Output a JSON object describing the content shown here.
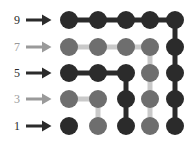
{
  "figure": {
    "type": "graph-lattice-diagram",
    "background_color": "#ffffff",
    "width": 190,
    "height": 148
  },
  "colors": {
    "dark": "#2b2b2b",
    "medium_gray": "#6e6e6e",
    "light_gray": "#c9c9c9",
    "label_dark": "#2b2b2b",
    "label_gray": "#9a9a9a"
  },
  "axis": {
    "orientation": "vertical-left",
    "rows": [
      {
        "label": "9",
        "y": 20,
        "color": "#2b2b2b",
        "arrow_color": "#2b2b2b"
      },
      {
        "label": "7",
        "y": 47,
        "color": "#9a9a9a",
        "arrow_color": "#9a9a9a"
      },
      {
        "label": "5",
        "y": 73,
        "color": "#2b2b2b",
        "arrow_color": "#2b2b2b"
      },
      {
        "label": "3",
        "y": 99,
        "color": "#9a9a9a",
        "arrow_color": "#9a9a9a"
      },
      {
        "label": "1",
        "y": 126,
        "color": "#2b2b2b",
        "arrow_color": "#2b2b2b"
      }
    ]
  },
  "chart_data": {
    "type": "scatter",
    "title": "",
    "xlabel": "",
    "ylabel": "",
    "grid": false,
    "columns_x": [
      69,
      98,
      126,
      150,
      175
    ],
    "rows_y": [
      20,
      47,
      73,
      99,
      126
    ],
    "row_labels": [
      "9",
      "7",
      "5",
      "3",
      "1"
    ],
    "node_radius": 9,
    "nodes": [
      {
        "id": "r9c1",
        "row": "9",
        "col": 1,
        "x": 69,
        "y": 20,
        "color": "#2b2b2b",
        "shade": "dark"
      },
      {
        "id": "r9c2",
        "row": "9",
        "col": 2,
        "x": 98,
        "y": 20,
        "color": "#2b2b2b",
        "shade": "dark"
      },
      {
        "id": "r9c3",
        "row": "9",
        "col": 3,
        "x": 126,
        "y": 20,
        "color": "#2b2b2b",
        "shade": "dark"
      },
      {
        "id": "r9c4",
        "row": "9",
        "col": 4,
        "x": 150,
        "y": 20,
        "color": "#2b2b2b",
        "shade": "dark"
      },
      {
        "id": "r9c5",
        "row": "9",
        "col": 5,
        "x": 175,
        "y": 20,
        "color": "#2b2b2b",
        "shade": "dark"
      },
      {
        "id": "r7c1",
        "row": "7",
        "col": 1,
        "x": 69,
        "y": 47,
        "color": "#6e6e6e",
        "shade": "gray"
      },
      {
        "id": "r7c2",
        "row": "7",
        "col": 2,
        "x": 98,
        "y": 47,
        "color": "#6e6e6e",
        "shade": "gray"
      },
      {
        "id": "r7c3",
        "row": "7",
        "col": 3,
        "x": 126,
        "y": 47,
        "color": "#6e6e6e",
        "shade": "gray"
      },
      {
        "id": "r7c4",
        "row": "7",
        "col": 4,
        "x": 150,
        "y": 47,
        "color": "#6e6e6e",
        "shade": "gray"
      },
      {
        "id": "r7c5",
        "row": "7",
        "col": 5,
        "x": 175,
        "y": 47,
        "color": "#2b2b2b",
        "shade": "dark"
      },
      {
        "id": "r5c1",
        "row": "5",
        "col": 1,
        "x": 69,
        "y": 73,
        "color": "#2b2b2b",
        "shade": "dark"
      },
      {
        "id": "r5c2",
        "row": "5",
        "col": 2,
        "x": 98,
        "y": 73,
        "color": "#2b2b2b",
        "shade": "dark"
      },
      {
        "id": "r5c3",
        "row": "5",
        "col": 3,
        "x": 126,
        "y": 73,
        "color": "#2b2b2b",
        "shade": "dark"
      },
      {
        "id": "r5c4",
        "row": "5",
        "col": 4,
        "x": 150,
        "y": 73,
        "color": "#6e6e6e",
        "shade": "gray"
      },
      {
        "id": "r5c5",
        "row": "5",
        "col": 5,
        "x": 175,
        "y": 73,
        "color": "#2b2b2b",
        "shade": "dark"
      },
      {
        "id": "r3c1",
        "row": "3",
        "col": 1,
        "x": 69,
        "y": 99,
        "color": "#6e6e6e",
        "shade": "gray"
      },
      {
        "id": "r3c2",
        "row": "3",
        "col": 2,
        "x": 98,
        "y": 99,
        "color": "#6e6e6e",
        "shade": "gray"
      },
      {
        "id": "r3c3",
        "row": "3",
        "col": 3,
        "x": 126,
        "y": 99,
        "color": "#2b2b2b",
        "shade": "dark"
      },
      {
        "id": "r3c4",
        "row": "3",
        "col": 4,
        "x": 150,
        "y": 99,
        "color": "#6e6e6e",
        "shade": "gray"
      },
      {
        "id": "r3c5",
        "row": "3",
        "col": 5,
        "x": 175,
        "y": 99,
        "color": "#2b2b2b",
        "shade": "dark"
      },
      {
        "id": "r1c1",
        "row": "1",
        "col": 1,
        "x": 69,
        "y": 126,
        "color": "#2b2b2b",
        "shade": "dark"
      },
      {
        "id": "r1c2",
        "row": "1",
        "col": 2,
        "x": 98,
        "y": 126,
        "color": "#6e6e6e",
        "shade": "gray"
      },
      {
        "id": "r1c3",
        "row": "1",
        "col": 3,
        "x": 126,
        "y": 126,
        "color": "#2b2b2b",
        "shade": "dark"
      },
      {
        "id": "r1c4",
        "row": "1",
        "col": 4,
        "x": 150,
        "y": 126,
        "color": "#6e6e6e",
        "shade": "gray"
      },
      {
        "id": "r1c5",
        "row": "1",
        "col": 5,
        "x": 175,
        "y": 126,
        "color": "#2b2b2b",
        "shade": "dark"
      }
    ],
    "edges": [
      {
        "from": "r9c1",
        "to": "r9c2",
        "x1": 69,
        "y1": 20,
        "x2": 98,
        "y2": 20,
        "color": "#2b2b2b",
        "width": 5,
        "shade": "dark"
      },
      {
        "from": "r9c2",
        "to": "r9c3",
        "x1": 98,
        "y1": 20,
        "x2": 126,
        "y2": 20,
        "color": "#2b2b2b",
        "width": 5,
        "shade": "dark"
      },
      {
        "from": "r9c3",
        "to": "r9c4",
        "x1": 126,
        "y1": 20,
        "x2": 150,
        "y2": 20,
        "color": "#2b2b2b",
        "width": 5,
        "shade": "dark"
      },
      {
        "from": "r9c4",
        "to": "r9c5",
        "x1": 150,
        "y1": 20,
        "x2": 175,
        "y2": 20,
        "color": "#2b2b2b",
        "width": 5,
        "shade": "dark"
      },
      {
        "from": "r7c1",
        "to": "r7c2",
        "x1": 69,
        "y1": 47,
        "x2": 98,
        "y2": 47,
        "color": "#c9c9c9",
        "width": 5,
        "shade": "light"
      },
      {
        "from": "r7c2",
        "to": "r7c3",
        "x1": 98,
        "y1": 47,
        "x2": 126,
        "y2": 47,
        "color": "#c9c9c9",
        "width": 5,
        "shade": "light"
      },
      {
        "from": "r7c3",
        "to": "r7c4",
        "x1": 126,
        "y1": 47,
        "x2": 150,
        "y2": 47,
        "color": "#c9c9c9",
        "width": 5,
        "shade": "light"
      },
      {
        "from": "r5c1",
        "to": "r5c2",
        "x1": 69,
        "y1": 73,
        "x2": 98,
        "y2": 73,
        "color": "#2b2b2b",
        "width": 5,
        "shade": "dark"
      },
      {
        "from": "r5c2",
        "to": "r5c3",
        "x1": 98,
        "y1": 73,
        "x2": 126,
        "y2": 73,
        "color": "#2b2b2b",
        "width": 5,
        "shade": "dark"
      },
      {
        "from": "r3c1",
        "to": "r3c2",
        "x1": 69,
        "y1": 99,
        "x2": 98,
        "y2": 99,
        "color": "#c9c9c9",
        "width": 5,
        "shade": "light"
      },
      {
        "from": "r9c5",
        "to": "r7c5",
        "x1": 175,
        "y1": 20,
        "x2": 175,
        "y2": 47,
        "color": "#2b2b2b",
        "width": 5,
        "shade": "dark"
      },
      {
        "from": "r7c5",
        "to": "r5c5",
        "x1": 175,
        "y1": 47,
        "x2": 175,
        "y2": 73,
        "color": "#2b2b2b",
        "width": 5,
        "shade": "dark"
      },
      {
        "from": "r5c5",
        "to": "r3c5",
        "x1": 175,
        "y1": 73,
        "x2": 175,
        "y2": 99,
        "color": "#2b2b2b",
        "width": 5,
        "shade": "dark"
      },
      {
        "from": "r3c5",
        "to": "r1c5",
        "x1": 175,
        "y1": 99,
        "x2": 175,
        "y2": 126,
        "color": "#2b2b2b",
        "width": 5,
        "shade": "dark"
      },
      {
        "from": "r7c4",
        "to": "r5c4",
        "x1": 150,
        "y1": 47,
        "x2": 150,
        "y2": 73,
        "color": "#c9c9c9",
        "width": 5,
        "shade": "light"
      },
      {
        "from": "r5c4",
        "to": "r3c4",
        "x1": 150,
        "y1": 73,
        "x2": 150,
        "y2": 99,
        "color": "#c9c9c9",
        "width": 5,
        "shade": "light"
      },
      {
        "from": "r3c4",
        "to": "r1c4",
        "x1": 150,
        "y1": 99,
        "x2": 150,
        "y2": 126,
        "color": "#c9c9c9",
        "width": 5,
        "shade": "light"
      },
      {
        "from": "r5c3",
        "to": "r3c3",
        "x1": 126,
        "y1": 73,
        "x2": 126,
        "y2": 99,
        "color": "#2b2b2b",
        "width": 5,
        "shade": "dark"
      },
      {
        "from": "r3c3",
        "to": "r1c3",
        "x1": 126,
        "y1": 99,
        "x2": 126,
        "y2": 126,
        "color": "#2b2b2b",
        "width": 5,
        "shade": "dark"
      },
      {
        "from": "r3c2",
        "to": "r1c2",
        "x1": 98,
        "y1": 99,
        "x2": 98,
        "y2": 126,
        "color": "#c9c9c9",
        "width": 5,
        "shade": "light"
      }
    ]
  }
}
